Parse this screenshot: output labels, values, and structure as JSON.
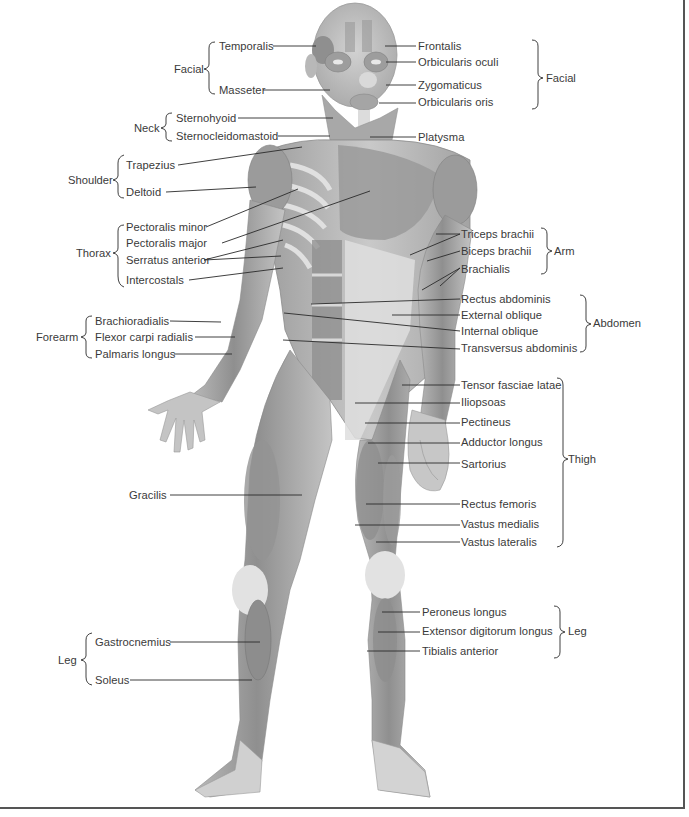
{
  "figure": {
    "colors": {
      "line": "#2a2a2a",
      "muscle_dark": "#8a8a8a",
      "muscle_mid": "#a8a8a8",
      "muscle_light": "#cfcfcf",
      "tendon": "#e8e8e8",
      "frame": "#555555",
      "text": "#3a3a3a"
    }
  },
  "left_groups": [
    {
      "group": "Facial",
      "labels": [
        "Temporalis",
        "Masseter"
      ]
    },
    {
      "group": "Neck",
      "labels": [
        "Sternohyoid",
        "Sternocleidomastoid"
      ]
    },
    {
      "group": "Shoulder",
      "labels": [
        "Trapezius",
        "Deltoid"
      ]
    },
    {
      "group": "Thorax",
      "labels": [
        "Pectoralis minor",
        "Pectoralis major",
        "Serratus anterior",
        "Intercostals"
      ]
    },
    {
      "group": "Forearm",
      "labels": [
        "Brachioradialis",
        "Flexor carpi radialis",
        "Palmaris longus"
      ]
    },
    {
      "group": "",
      "labels": [
        "Gracilis"
      ]
    },
    {
      "group": "Leg",
      "labels": [
        "Gastrocnemius",
        "Soleus"
      ]
    }
  ],
  "right_groups": [
    {
      "group": "Facial",
      "labels": [
        "Frontalis",
        "Orbicularis oculi",
        "Zygomaticus",
        "Orbicularis oris"
      ]
    },
    {
      "group": "",
      "labels": [
        "Platysma"
      ]
    },
    {
      "group": "Arm",
      "labels": [
        "Triceps brachii",
        "Biceps brachii",
        "Brachialis"
      ]
    },
    {
      "group": "Abdomen",
      "labels": [
        "Rectus abdominis",
        "External oblique",
        "Internal oblique",
        "Transversus abdominis"
      ]
    },
    {
      "group": "Thigh",
      "labels": [
        "Tensor fasciae latae",
        "Iliopsoas",
        "Pectineus",
        "Adductor longus",
        "Sartorius",
        "Rectus femoris",
        "Vastus medialis",
        "Vastus lateralis"
      ]
    },
    {
      "group": "Leg",
      "labels": [
        "Peroneus longus",
        "Extensor digitorum longus",
        "Tibialis anterior"
      ]
    }
  ]
}
